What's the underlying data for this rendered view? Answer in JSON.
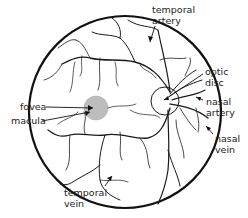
{
  "diagram": {
    "type": "retina-fundus",
    "colors": {
      "outline": "#111111",
      "vessels": "#1a1a1a",
      "macula": "#bdbdbd",
      "text": "#222222",
      "background": "#ffffff"
    },
    "labels": {
      "temporal_artery": {
        "line1": "temporal",
        "line2": "artery"
      },
      "optic_disc": {
        "line1": "optic",
        "line2": "disc"
      },
      "nasal_artery": {
        "line1": "nasal",
        "line2": "artery"
      },
      "nasal_vein": {
        "line1": "nasal",
        "line2": "vein"
      },
      "fovea": {
        "line1": "fovea"
      },
      "macula": {
        "line1": "macula"
      },
      "temporal_vein": {
        "line1": "temporal",
        "line2": "vein"
      }
    }
  }
}
